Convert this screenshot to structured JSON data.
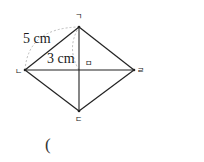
{
  "diagram": {
    "vertices": {
      "top": "ㄱ",
      "left": "ㄴ",
      "bottom": "ㄷ",
      "right": "ㄹ",
      "center": "ㅁ"
    },
    "measurements": {
      "side": "5 cm",
      "half_diagonal": "3 cm"
    },
    "answer_open_paren": "("
  }
}
